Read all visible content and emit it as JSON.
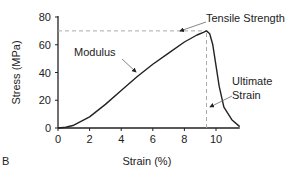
{
  "panel_label": "B",
  "chart_data": {
    "type": "line",
    "title": "",
    "xlabel": "Strain (%)",
    "ylabel": "Stress (MPa)",
    "xlim": [
      0,
      11.5
    ],
    "ylim": [
      0,
      80
    ],
    "xticks": [
      0,
      2,
      4,
      6,
      8,
      10
    ],
    "yticks": [
      0,
      20,
      40,
      60,
      80
    ],
    "grid": false,
    "series": [
      {
        "name": "stress-strain curve",
        "x": [
          0,
          0.5,
          1,
          2,
          3,
          4,
          5,
          6,
          7,
          8,
          8.8,
          9.2,
          9.4,
          9.6,
          9.8,
          10,
          10.2,
          10.5,
          11,
          11.5
        ],
        "y": [
          0,
          0.5,
          2,
          8,
          17,
          27,
          37,
          46,
          54,
          62,
          67,
          69,
          70,
          68,
          60,
          45,
          30,
          15,
          6,
          1
        ]
      }
    ],
    "annotations": [
      {
        "text": "Tensile Strength",
        "x": 9.4,
        "y": 70
      },
      {
        "text": "Modulus",
        "x": 4.5,
        "y": 40
      },
      {
        "text": "Ultimate Strain",
        "x": 9.4,
        "y": 0
      }
    ],
    "reference_lines": [
      {
        "type": "horizontal",
        "y": 70,
        "x_to": 9.4,
        "style": "dashed"
      },
      {
        "type": "vertical",
        "x": 9.4,
        "y_to": 70,
        "style": "dashed"
      }
    ]
  }
}
